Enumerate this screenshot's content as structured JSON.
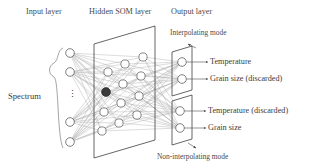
{
  "figure": {
    "type": "neural-network-architecture-diagram",
    "background_color": "#ffffff",
    "ink_color": "#4a4a4a",
    "node_fill": "#ffffff",
    "node_stroke": "#555555",
    "bmu_fill": "#3a3a3a",
    "connection_color": "#9a9a9a"
  },
  "titles": {
    "input_layer": "Input layer",
    "hidden_layer": "Hidden SOM layer",
    "output_layer": "Output layer"
  },
  "modes": {
    "interpolating": "Interpolating mode",
    "non_interpolating": "Non-interpolating mode"
  },
  "input": {
    "brace_label": "Spectrum",
    "node_count_shown": 4,
    "ellipsis": "⋮"
  },
  "hidden": {
    "grid_columns": 3,
    "grid_rows": 4,
    "winning_node_label": "best-matching-unit"
  },
  "outputs": {
    "top_plane": [
      {
        "label": "Temperature",
        "discarded": false
      },
      {
        "label": "Grain size (discarded)",
        "discarded": true
      }
    ],
    "bottom_plane": [
      {
        "label": "Temperature (discarded)",
        "discarded": true
      },
      {
        "label": "Grain size",
        "discarded": false
      }
    ]
  }
}
